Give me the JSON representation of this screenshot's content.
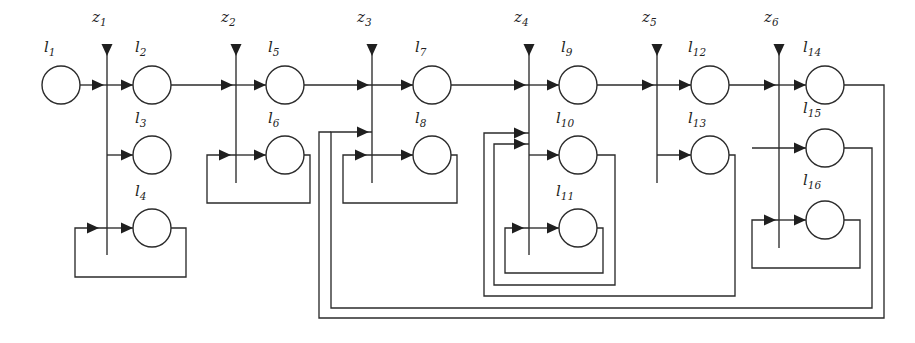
{
  "diagram": {
    "type": "block-flow-diagram",
    "canvas": {
      "width": 915,
      "height": 343
    },
    "colors": {
      "background": "#ffffff",
      "stroke": "#2b2b2b",
      "thin_stroke": "#3a3a3a",
      "arrow_fill": "#1f1f1f",
      "node_fill": "#ffffff",
      "text": "#1f1f1f"
    },
    "nodes": [
      {
        "id": "l1",
        "base": "l",
        "sub": "1",
        "label": "l1",
        "cx": 61,
        "cy": 85,
        "r": 19,
        "row": "top",
        "stage": 0
      },
      {
        "id": "l2",
        "base": "l",
        "sub": "2",
        "label": "l2",
        "cx": 152,
        "cy": 85,
        "r": 19,
        "row": "top",
        "stage": 1
      },
      {
        "id": "l3",
        "base": "l",
        "sub": "3",
        "label": "l3",
        "cx": 152,
        "cy": 155,
        "r": 19,
        "row": "middle",
        "stage": 1
      },
      {
        "id": "l4",
        "base": "l",
        "sub": "4",
        "label": "l4",
        "cx": 152,
        "cy": 228,
        "r": 19,
        "row": "bottom",
        "stage": 1
      },
      {
        "id": "l5",
        "base": "l",
        "sub": "5",
        "label": "l5",
        "cx": 285,
        "cy": 85,
        "r": 19,
        "row": "top",
        "stage": 2
      },
      {
        "id": "l6",
        "base": "l",
        "sub": "6",
        "label": "l6",
        "cx": 285,
        "cy": 155,
        "r": 19,
        "row": "middle",
        "stage": 2
      },
      {
        "id": "l7",
        "base": "l",
        "sub": "7",
        "label": "l7",
        "cx": 432,
        "cy": 85,
        "r": 19,
        "row": "top",
        "stage": 3
      },
      {
        "id": "l8",
        "base": "l",
        "sub": "8",
        "label": "l8",
        "cx": 432,
        "cy": 155,
        "r": 19,
        "row": "middle",
        "stage": 3
      },
      {
        "id": "l9",
        "base": "l",
        "sub": "9",
        "label": "l9",
        "cx": 578,
        "cy": 85,
        "r": 19,
        "row": "top",
        "stage": 4
      },
      {
        "id": "l10",
        "base": "l",
        "sub": "10",
        "label": "l10",
        "cx": 578,
        "cy": 155,
        "r": 19,
        "row": "middle",
        "stage": 4
      },
      {
        "id": "l11",
        "base": "l",
        "sub": "11",
        "label": "l11",
        "cx": 578,
        "cy": 228,
        "r": 19,
        "row": "bottom",
        "stage": 4
      },
      {
        "id": "l12",
        "base": "l",
        "sub": "12",
        "label": "l12",
        "cx": 710,
        "cy": 85,
        "r": 19,
        "row": "top",
        "stage": 5
      },
      {
        "id": "l13",
        "base": "l",
        "sub": "13",
        "label": "l13",
        "cx": 710,
        "cy": 155,
        "r": 19,
        "row": "middle",
        "stage": 5
      },
      {
        "id": "l14",
        "base": "l",
        "sub": "14",
        "label": "l14",
        "cx": 825,
        "cy": 85,
        "r": 19,
        "row": "top",
        "stage": 6
      },
      {
        "id": "l15",
        "base": "l",
        "sub": "15",
        "label": "l15",
        "cx": 825,
        "cy": 148,
        "r": 19,
        "row": "middle",
        "stage": 6
      },
      {
        "id": "l16",
        "base": "l",
        "sub": "16",
        "label": "l16",
        "cx": 825,
        "cy": 220,
        "r": 19,
        "row": "bottom",
        "stage": 6
      }
    ],
    "node_labels": [
      {
        "for": "l1",
        "base": "l",
        "sub": "1",
        "x": 44,
        "y": 52
      },
      {
        "for": "l2",
        "base": "l",
        "sub": "2",
        "x": 135,
        "y": 52
      },
      {
        "for": "l3",
        "base": "l",
        "sub": "3",
        "x": 135,
        "y": 123
      },
      {
        "for": "l4",
        "base": "l",
        "sub": "4",
        "x": 135,
        "y": 196
      },
      {
        "for": "l5",
        "base": "l",
        "sub": "5",
        "x": 268,
        "y": 52
      },
      {
        "for": "l6",
        "base": "l",
        "sub": "6",
        "x": 268,
        "y": 123
      },
      {
        "for": "l7",
        "base": "l",
        "sub": "7",
        "x": 415,
        "y": 52
      },
      {
        "for": "l8",
        "base": "l",
        "sub": "8",
        "x": 415,
        "y": 123
      },
      {
        "for": "l9",
        "base": "l",
        "sub": "9",
        "x": 561,
        "y": 52
      },
      {
        "for": "l10",
        "base": "l",
        "sub": "10",
        "x": 556,
        "y": 123
      },
      {
        "for": "l11",
        "base": "l",
        "sub": "11",
        "x": 556,
        "y": 196
      },
      {
        "for": "l12",
        "base": "l",
        "sub": "12",
        "x": 688,
        "y": 52
      },
      {
        "for": "l13",
        "base": "l",
        "sub": "13",
        "x": 688,
        "y": 123
      },
      {
        "for": "l14",
        "base": "l",
        "sub": "14",
        "x": 803,
        "y": 52
      },
      {
        "for": "l15",
        "base": "l",
        "sub": "15",
        "x": 803,
        "y": 113
      },
      {
        "for": "l16",
        "base": "l",
        "sub": "16",
        "x": 803,
        "y": 185
      }
    ],
    "z_inputs": [
      {
        "id": "z1",
        "base": "z",
        "sub": "1",
        "label": "z1",
        "x": 107,
        "label_x": 92,
        "label_y": 22,
        "top": 48,
        "bottom": 255
      },
      {
        "id": "z2",
        "base": "z",
        "sub": "2",
        "label": "z2",
        "x": 236,
        "label_x": 221,
        "label_y": 22,
        "top": 48,
        "bottom": 183
      },
      {
        "id": "z3",
        "base": "z",
        "sub": "3",
        "label": "z3",
        "x": 372,
        "label_x": 357,
        "label_y": 22,
        "top": 48,
        "bottom": 183
      },
      {
        "id": "z4",
        "base": "z",
        "sub": "4",
        "label": "z4",
        "x": 529,
        "label_x": 514,
        "label_y": 22,
        "top": 48,
        "bottom": 255
      },
      {
        "id": "z5",
        "base": "z",
        "sub": "5",
        "label": "z5",
        "x": 657,
        "label_x": 642,
        "label_y": 22,
        "top": 48,
        "bottom": 183
      },
      {
        "id": "z6",
        "base": "z",
        "sub": "6",
        "label": "z6",
        "x": 779,
        "label_x": 764,
        "label_y": 22,
        "top": 48,
        "bottom": 248
      }
    ],
    "main_chain": [
      {
        "from": "l1",
        "to": "l2",
        "via_z": "z1"
      },
      {
        "from": "l2",
        "to": "l5",
        "via_z": "z2"
      },
      {
        "from": "l5",
        "to": "l7",
        "via_z": "z3"
      },
      {
        "from": "l7",
        "to": "l9",
        "via_z": "z4"
      },
      {
        "from": "l9",
        "to": "l12",
        "via_z": "z5"
      },
      {
        "from": "l12",
        "to": "l14",
        "via_z": "z6"
      }
    ],
    "branches": [
      {
        "from_z": "z1",
        "to": "l3"
      },
      {
        "from_z": "z1",
        "to": "l4"
      },
      {
        "from_z": "z2",
        "to": "l6"
      },
      {
        "from_z": "z3",
        "to": "l8"
      },
      {
        "from_z": "z4",
        "to": "l10"
      },
      {
        "from_z": "z4",
        "to": "l11"
      },
      {
        "from_z": "z5",
        "to": "l13"
      },
      {
        "from_z": "z6",
        "to": "l15"
      },
      {
        "from_z": "z6",
        "to": "l16"
      }
    ],
    "feedback_loops": [
      {
        "id": "fb-l4",
        "from": "l4",
        "to_z": "z1",
        "right_x": 186,
        "bottom_y": 277,
        "left_x": 75
      },
      {
        "id": "fb-l6",
        "from": "l6",
        "to_z": "z2",
        "right_x": 310,
        "bottom_y": 203,
        "left_x": 207
      },
      {
        "id": "fb-l8",
        "from": "l8",
        "to_z": "z3",
        "right_x": 457,
        "bottom_y": 203,
        "left_x": 343
      },
      {
        "id": "fb-l11",
        "from": "l11",
        "to_z": "z4",
        "right_x": 603,
        "bottom_y": 273,
        "left_x": 505
      },
      {
        "id": "fb-l10",
        "from": "l10",
        "to_z": "z4",
        "right_x": 615,
        "bottom_y": 285,
        "left_x": 494
      },
      {
        "id": "fb-l13",
        "from": "l13",
        "to_z": "z4",
        "right_x": 735,
        "bottom_y": 296,
        "left_x": 484
      },
      {
        "id": "fb-l16",
        "from": "l16",
        "to_z": "z6",
        "right_x": 860,
        "bottom_y": 268,
        "left_x": 752
      },
      {
        "id": "fb-l15",
        "from": "l15",
        "to_z": "z3",
        "right_x": 872,
        "bottom_y": 308,
        "left_x": 331
      },
      {
        "id": "fb-l14",
        "from": "l14",
        "to_z": "z3",
        "right_x": 884,
        "bottom_y": 318,
        "left_x": 331
      }
    ],
    "counts": {
      "nodes": 16,
      "z_inputs": 6,
      "feedback_loops": 9,
      "stages": 7
    }
  }
}
